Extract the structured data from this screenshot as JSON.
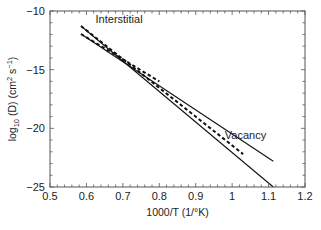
{
  "chart_data": {
    "type": "line",
    "title": "",
    "xlabel": "1000/T (1/°K)",
    "ylabel_parts": {
      "base": "log",
      "sub": "10",
      "mid": " (D) (cm",
      "sup1": "2",
      "mid2": " s",
      "sup2": "−1",
      "end": ")"
    },
    "ylabel": "log10 (D) (cm2 s-1)",
    "xlim": [
      0.5,
      1.2
    ],
    "ylim": [
      -25,
      -10
    ],
    "grid": false,
    "x_ticks": [
      0.5,
      0.6,
      0.7,
      0.8,
      0.9,
      1.0,
      1.1,
      1.2
    ],
    "x_tick_labels": [
      "0.5",
      "0.6",
      "0.7",
      "0.8",
      "0.9",
      "1",
      "1.1",
      "1.2"
    ],
    "y_ticks": [
      -10,
      -15,
      -20,
      -25
    ],
    "y_tick_labels": [
      "−10",
      "−15",
      "−20",
      "−25"
    ],
    "x_minor_step": 0.02,
    "y_minor_step": 1,
    "series": [
      {
        "name": "Interstitial",
        "style": "solid",
        "x": [
          0.585,
          1.113
        ],
        "y": [
          -11.28,
          -25.0
        ]
      },
      {
        "name": "Vacancy",
        "style": "solid",
        "x": [
          0.585,
          1.113
        ],
        "y": [
          -11.96,
          -22.8
        ]
      },
      {
        "name": "Interstitial (dashed)",
        "style": "dashed",
        "x": [
          0.585,
          1.03
        ],
        "y": [
          -11.28,
          -22.2
        ]
      },
      {
        "name": "Vacancy (dashed)",
        "style": "dashed",
        "x": [
          0.585,
          0.8
        ],
        "y": [
          -11.96,
          -16.0
        ]
      }
    ],
    "annotations": [
      {
        "text": "Interstitial",
        "x": 0.625,
        "y": -11.0
      },
      {
        "text": "Vacancy",
        "x": 0.98,
        "y": -20.9
      }
    ],
    "line_color": "#111111"
  }
}
